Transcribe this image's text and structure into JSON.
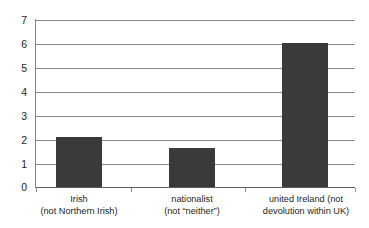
{
  "chart_data": {
    "type": "bar",
    "title": "",
    "subtitle": "",
    "xlabel": "",
    "ylabel": "",
    "categories": [
      "Irish (not Northern Irish)",
      "nationalist (not “neither”)",
      "united Ireland (not devolution within UK)"
    ],
    "category_lines": [
      [
        "Irish",
        "(not Northern Irish)"
      ],
      [
        "nationalist",
        "(not “neither”)"
      ],
      [
        "united Ireland (not",
        "devolution within UK)"
      ]
    ],
    "values": [
      2.1,
      1.65,
      6.05
    ],
    "ylim": [
      0,
      7
    ],
    "yticks": [
      0,
      1,
      2,
      3,
      4,
      5,
      6,
      7
    ],
    "ytick_labels": [
      "0",
      "1",
      "2",
      "3",
      "4",
      "5",
      "6",
      "7"
    ],
    "grid": true,
    "legend": false,
    "legend_position": "none",
    "bar_color": "#3a3a3a",
    "gridline_color": "#8c8c8c",
    "axis_color": "#868686",
    "text_color": "#231f20",
    "background": "#ffffff"
  },
  "axis": {
    "y_labels": [
      "7",
      "6",
      "5",
      "4",
      "3",
      "2",
      "1",
      "0"
    ]
  },
  "labels": {
    "cat0_line1": "Irish",
    "cat0_line2": "(not Northern Irish)",
    "cat1_line1": "nationalist",
    "cat1_line2": "(not “neither”)",
    "cat2_line1": "united Ireland (not",
    "cat2_line2": "devolution within UK)"
  }
}
